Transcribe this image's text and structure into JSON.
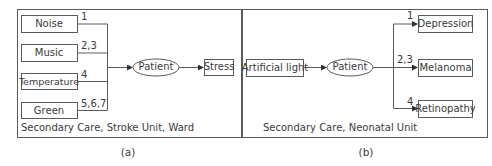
{
  "panels": [
    {
      "id": "a",
      "caption": "(a)",
      "setting": "Secondary Care, Stroke Unit, Ward",
      "factors": [
        {
          "label": "Noise",
          "refs": "1"
        },
        {
          "label": "Music",
          "refs": "2,3"
        },
        {
          "label": "Temperature",
          "refs": "4"
        },
        {
          "label": "Green",
          "refs": "5,6,7"
        }
      ],
      "subject": "Patient",
      "outcomes": [
        {
          "label": "Stress"
        }
      ]
    },
    {
      "id": "b",
      "caption": "(b)",
      "setting": "Secondary Care, Neonatal Unit",
      "factors": [
        {
          "label": "Artificial light"
        }
      ],
      "subject": "Patient",
      "outcomes": [
        {
          "label": "Depression",
          "refs": "1"
        },
        {
          "label": "Melanoma",
          "refs": "2,3"
        },
        {
          "label": "Retinopathy",
          "refs": "4"
        }
      ]
    }
  ],
  "colors": {
    "stroke": "#5a5a5a",
    "text": "#3a3a3a",
    "background": "#ffffff"
  }
}
